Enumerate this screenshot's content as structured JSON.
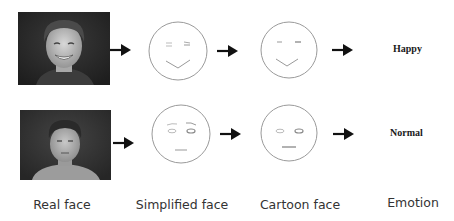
{
  "diagram": {
    "stages": [
      "Real face",
      "Simplified face",
      "Cartoon face",
      "Emotion"
    ],
    "rows": [
      {
        "id": "happy-row",
        "real_face": "photo of smiling man with curly hair",
        "simplified_face": "smiling line face with squinting eyes",
        "cartoon_face": "smiling cartoon face",
        "emotion": "Happy"
      },
      {
        "id": "normal-row",
        "real_face": "photo of man with neutral expression",
        "simplified_face": "neutral line face with eyebrows and flat mouth",
        "cartoon_face": "neutral cartoon face with flat mouth",
        "emotion": "Normal"
      }
    ],
    "captions": {
      "real": "Real face",
      "simplified": "Simplified face",
      "cartoon": "Cartoon face",
      "emotion": "Emotion"
    },
    "icons": {
      "arrow": "right-arrow-icon"
    },
    "colors": {
      "face_stroke": "#9a9a9a",
      "arrow": "#111111",
      "photo_bg": "#2b2b2b",
      "caption_text": "#333333"
    }
  }
}
